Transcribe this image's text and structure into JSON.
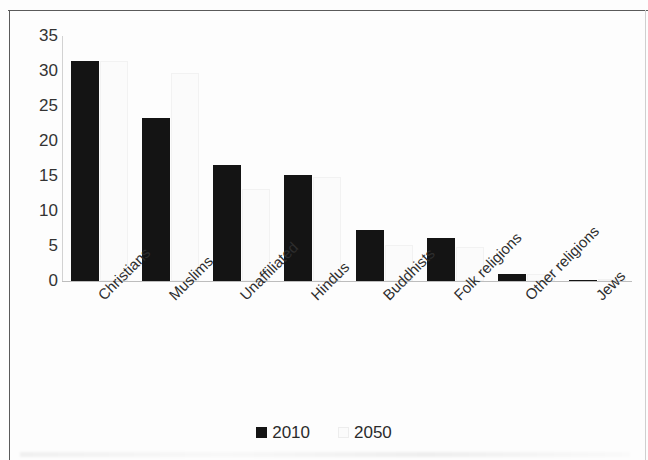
{
  "chart_data": {
    "type": "bar",
    "title": "",
    "subtitle": "",
    "xlabel": "",
    "ylabel": "",
    "ylim": [
      0,
      35
    ],
    "yticks": [
      0,
      5,
      10,
      15,
      20,
      25,
      30,
      35
    ],
    "ytick_labels": [
      "0",
      "5",
      "10",
      "15",
      "20",
      "25",
      "30",
      "35"
    ],
    "grid": false,
    "legend_position": "bottom-center",
    "categories": [
      "Christians",
      "Muslims",
      "Unaffiliated",
      "Hindus",
      "Buddhists",
      "Folk religions",
      "Other religions",
      "Jews"
    ],
    "series": [
      {
        "name": "2010",
        "color": "#141414",
        "values": [
          31.4,
          23.3,
          16.6,
          15.2,
          7.3,
          6.2,
          1.0,
          0.2
        ]
      },
      {
        "name": "2050",
        "color": "#fbfbfb",
        "values": [
          31.4,
          29.7,
          13.2,
          14.9,
          5.2,
          4.8,
          1.0,
          0.2
        ]
      }
    ]
  },
  "legend": {
    "items": [
      {
        "label": "2010",
        "swatch": "dark-square-swatch"
      },
      {
        "label": "2050",
        "swatch": "light-square-swatch"
      }
    ]
  }
}
